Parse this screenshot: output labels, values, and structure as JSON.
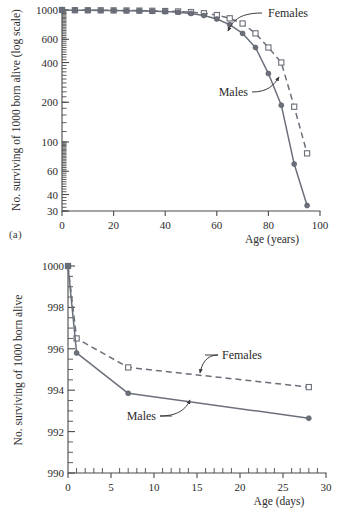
{
  "figure": {
    "panels": [
      {
        "id": "a",
        "panel_label": "(a)"
      },
      {
        "id": "b",
        "panel_label": "(b)"
      }
    ]
  },
  "chart_data": [
    {
      "type": "line",
      "panel": "(a)",
      "title": "",
      "xlabel": "Age (years)",
      "ylabel": "No. surviving of 1000 born alive (log scale)",
      "yscale": "log",
      "xlim": [
        0,
        100
      ],
      "ylim": [
        30,
        1000
      ],
      "xticks": [
        0,
        20,
        40,
        60,
        80,
        100
      ],
      "xticklabels": [
        "0",
        "20",
        "40",
        "60",
        "80",
        "100"
      ],
      "yticks": [
        1000,
        600,
        400,
        200,
        100,
        60,
        40,
        30
      ],
      "yticklabels": [
        "1000",
        "600",
        "400",
        "200",
        "100",
        "60",
        "40",
        "30"
      ],
      "grid": false,
      "legend_position": "inline-annotations",
      "x": [
        0,
        5,
        10,
        15,
        20,
        25,
        30,
        35,
        40,
        45,
        50,
        55,
        60,
        65,
        70,
        75,
        80,
        85,
        90,
        95
      ],
      "series": [
        {
          "name": "Females",
          "style": "dashed",
          "marker": "open-square",
          "values": [
            1000,
            996,
            995,
            994,
            993,
            991,
            989,
            986,
            982,
            975,
            964,
            945,
            915,
            865,
            790,
            665,
            520,
            400,
            185,
            82
          ]
        },
        {
          "name": "Males",
          "style": "solid",
          "marker": "filled-circle",
          "values": [
            1000,
            995,
            994,
            993,
            991,
            988,
            985,
            980,
            973,
            962,
            942,
            908,
            855,
            775,
            665,
            520,
            330,
            190,
            68,
            33
          ]
        }
      ],
      "annotations": [
        {
          "text": "Females",
          "points_to_series": "Females"
        },
        {
          "text": "Males",
          "points_to_series": "Males"
        }
      ]
    },
    {
      "type": "line",
      "panel": "(b)",
      "title": "",
      "xlabel": "Age (days)",
      "ylabel": "No. surviving of 1000 born alive",
      "yscale": "linear",
      "xlim": [
        0,
        30
      ],
      "ylim": [
        990,
        1000
      ],
      "xticks": [
        0,
        5,
        10,
        15,
        20,
        25,
        30
      ],
      "xticklabels": [
        "0",
        "5",
        "10",
        "15",
        "20",
        "25",
        "30"
      ],
      "xminorstep": 1,
      "yticks": [
        990,
        992,
        994,
        996,
        998,
        1000
      ],
      "yticklabels": [
        "990",
        "992",
        "994",
        "996",
        "998",
        "1000"
      ],
      "yminorstep": 0.5,
      "grid": false,
      "legend_position": "inline-annotations",
      "x": [
        0,
        1,
        7,
        28
      ],
      "series": [
        {
          "name": "Females",
          "style": "dashed",
          "marker": "open-square",
          "values": [
            1000,
            996.5,
            995.1,
            994.15
          ]
        },
        {
          "name": "Males",
          "style": "solid",
          "marker": "filled-circle",
          "values": [
            1000,
            995.8,
            993.85,
            992.65
          ]
        }
      ],
      "annotations": [
        {
          "text": "Females",
          "points_to_series": "Females"
        },
        {
          "text": "Males",
          "points_to_series": "Males"
        }
      ]
    }
  ]
}
